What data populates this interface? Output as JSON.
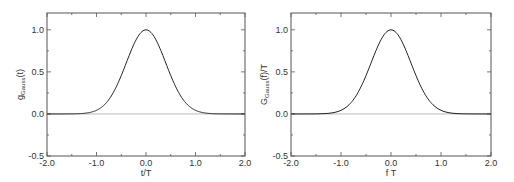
{
  "chart_data": [
    {
      "type": "line",
      "title": "",
      "xlabel": "t/T",
      "ylabel": "g_Gauss(t)",
      "ylabel_main": "g",
      "ylabel_sub": "Gauss",
      "ylabel_tail": "(t)",
      "xlim": [
        -2.0,
        2.0
      ],
      "ylim": [
        -0.5,
        1.2
      ],
      "xticks": [
        "-2.0",
        "-1.0",
        "0.0",
        "1.0",
        "2.0"
      ],
      "yticks": [
        "-0.5",
        "0.0",
        "0.5",
        "1.0"
      ],
      "grid": false,
      "series": [
        {
          "name": "gaussian",
          "x": [
            -2.0,
            -1.5,
            -1.25,
            -1.0,
            -0.75,
            -0.5,
            -0.25,
            0.0,
            0.25,
            0.5,
            0.75,
            1.0,
            1.25,
            1.5,
            2.0
          ],
          "y": [
            0.0,
            0.002,
            0.01,
            0.04,
            0.16,
            0.45,
            0.82,
            1.0,
            0.82,
            0.45,
            0.16,
            0.04,
            0.01,
            0.002,
            0.0
          ]
        },
        {
          "name": "zero-line",
          "x": [
            -2.0,
            2.0
          ],
          "y": [
            0.0,
            0.0
          ]
        }
      ]
    },
    {
      "type": "line",
      "title": "",
      "xlabel": "f T",
      "ylabel": "G_Gauss(f)/T",
      "ylabel_main": "G",
      "ylabel_sub": "Gauss",
      "ylabel_tail": "(f)/T",
      "xlim": [
        -2.0,
        2.0
      ],
      "ylim": [
        -0.5,
        1.2
      ],
      "xticks": [
        "-2.0",
        "-1.0",
        "0.0",
        "1.0",
        "2.0"
      ],
      "yticks": [
        "-0.5",
        "0.0",
        "0.5",
        "1.0"
      ],
      "grid": false,
      "series": [
        {
          "name": "gaussian",
          "x": [
            -2.0,
            -1.5,
            -1.25,
            -1.0,
            -0.75,
            -0.5,
            -0.25,
            0.0,
            0.25,
            0.5,
            0.75,
            1.0,
            1.25,
            1.5,
            2.0
          ],
          "y": [
            0.0,
            0.002,
            0.01,
            0.04,
            0.16,
            0.45,
            0.82,
            1.0,
            0.82,
            0.45,
            0.16,
            0.04,
            0.01,
            0.002,
            0.0
          ]
        },
        {
          "name": "zero-line",
          "x": [
            -2.0,
            2.0
          ],
          "y": [
            0.0,
            0.0
          ]
        }
      ]
    }
  ]
}
